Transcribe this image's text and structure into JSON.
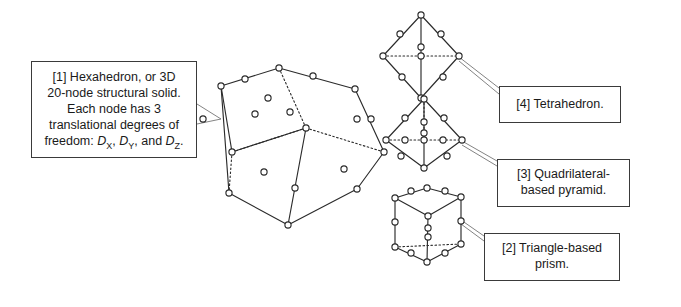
{
  "figure": {
    "background_color": "#ffffff",
    "ink_color": "#2b2b2b",
    "leader_color": "#6d6d6d",
    "box_border_color": "#3a3a3a"
  },
  "callouts": {
    "hexahedron": {
      "index": "[1]",
      "line1": "[1] Hexahedron, or 3D",
      "line2": "20-node structural solid.",
      "line3": "Each node has 3",
      "line4": "translational degrees of",
      "line5_prefix": "freedom: ",
      "dof_x": "D",
      "dof_x_sub": "X",
      "dof_sep1": ", ",
      "dof_y": "D",
      "dof_y_sub": "Y",
      "dof_sep2": ", and ",
      "dof_z": "D",
      "dof_z_sub": "Z",
      "line5_suffix": "."
    },
    "tetrahedron": {
      "index": "[4]",
      "label": "[4] Tetrahedron."
    },
    "pyramid": {
      "index": "[3]",
      "line1": "[3] Quadrilateral-",
      "line2": "based pyramid."
    },
    "prism": {
      "index": "[2]",
      "line1": "[2] Triangle-based",
      "line2": "prism."
    }
  },
  "shapes": {
    "hexahedron": {
      "name": "hexahedron-20-node-solid",
      "node_count": 20,
      "nodes": [
        [
          279,
          68
        ],
        [
          306,
          128
        ],
        [
          232,
          152
        ],
        [
          221,
          86
        ],
        [
          355,
          89
        ],
        [
          384,
          152
        ],
        [
          295,
          188
        ],
        [
          290,
          112
        ],
        [
          313,
          76
        ],
        [
          255,
          114
        ],
        [
          203,
          119
        ],
        [
          245,
          79
        ],
        [
          371,
          119
        ],
        [
          344,
          169
        ],
        [
          264,
          172
        ],
        [
          268,
          98
        ],
        [
          229,
          193
        ],
        [
          288,
          225
        ],
        [
          357,
          189
        ],
        [
          357,
          119
        ]
      ],
      "solid_edges": [
        [
          221,
          86,
          279,
          68
        ],
        [
          279,
          68,
          355,
          89
        ],
        [
          355,
          89,
          384,
          152
        ],
        [
          221,
          86,
          232,
          152
        ],
        [
          232,
          152,
          306,
          128
        ],
        [
          221,
          86,
          229,
          193
        ],
        [
          229,
          193,
          288,
          225
        ],
        [
          288,
          225,
          357,
          189
        ],
        [
          384,
          152,
          357,
          189
        ],
        [
          306,
          128,
          288,
          225
        ]
      ],
      "hidden_edges": [
        [
          279,
          68,
          306,
          128
        ],
        [
          306,
          128,
          232,
          152
        ],
        [
          232,
          152,
          229,
          193
        ],
        [
          306,
          128,
          384,
          152
        ]
      ]
    },
    "tetrahedron": {
      "name": "tetrahedron-10-node-solid",
      "node_count": 10,
      "nodes": [
        [
          421,
          15
        ],
        [
          383,
          56
        ],
        [
          459,
          56
        ],
        [
          421,
          98
        ],
        [
          400,
          34
        ],
        [
          441,
          34
        ],
        [
          421,
          47
        ],
        [
          402,
          77
        ],
        [
          443,
          77
        ],
        [
          421,
          56
        ]
      ],
      "solid_edges": [
        [
          421,
          15,
          383,
          56
        ],
        [
          421,
          15,
          459,
          56
        ],
        [
          383,
          56,
          421,
          98
        ],
        [
          459,
          56,
          421,
          98
        ],
        [
          421,
          15,
          421,
          98
        ]
      ],
      "hidden_edges": [
        [
          383,
          56,
          459,
          56
        ]
      ]
    },
    "pyramid": {
      "name": "quadrilateral-based-pyramid-13-node-solid",
      "node_count": 13,
      "nodes": [
        [
          424,
          99
        ],
        [
          386,
          140
        ],
        [
          462,
          140
        ],
        [
          424,
          168
        ],
        [
          405,
          118
        ],
        [
          444,
          118
        ],
        [
          424,
          133
        ],
        [
          401,
          156
        ],
        [
          447,
          156
        ],
        [
          405,
          140
        ],
        [
          443,
          140
        ],
        [
          424,
          140
        ],
        [
          424,
          122
        ]
      ],
      "solid_edges": [
        [
          424,
          99,
          386,
          140
        ],
        [
          424,
          99,
          462,
          140
        ],
        [
          386,
          140,
          424,
          168
        ],
        [
          462,
          140,
          424,
          168
        ],
        [
          424,
          99,
          424,
          168
        ]
      ],
      "hidden_edges": [
        [
          386,
          140,
          462,
          140
        ],
        [
          424,
          99,
          424,
          140
        ]
      ]
    },
    "prism": {
      "name": "triangle-based-prism-15-node-solid",
      "node_count": 15,
      "nodes": [
        [
          395,
          198
        ],
        [
          427,
          188
        ],
        [
          461,
          197
        ],
        [
          395,
          247
        ],
        [
          427,
          262
        ],
        [
          461,
          244
        ],
        [
          411,
          191
        ],
        [
          445,
          191
        ],
        [
          428,
          216
        ],
        [
          395,
          222
        ],
        [
          461,
          221
        ],
        [
          411,
          253
        ],
        [
          445,
          253
        ],
        [
          428,
          237
        ],
        [
          428,
          228
        ]
      ],
      "solid_edges": [
        [
          395,
          198,
          427,
          188
        ],
        [
          427,
          188,
          461,
          197
        ],
        [
          395,
          198,
          428,
          216
        ],
        [
          461,
          197,
          428,
          216
        ],
        [
          395,
          198,
          395,
          247
        ],
        [
          461,
          197,
          461,
          244
        ],
        [
          395,
          247,
          427,
          262
        ],
        [
          427,
          262,
          461,
          244
        ],
        [
          428,
          216,
          427,
          262
        ]
      ],
      "hidden_edges": [
        [
          395,
          247,
          461,
          244
        ]
      ]
    }
  },
  "leaders": [
    {
      "name": "leader-hexahedron-upper",
      "path": "M197 104 L221 119"
    },
    {
      "name": "leader-hexahedron-lower",
      "path": "M197 124 L221 119"
    },
    {
      "name": "leader-tetrahedron-upper",
      "path": "M459 57 L499 88"
    },
    {
      "name": "leader-tetrahedron-lower",
      "path": "M459 61 L499 94"
    },
    {
      "name": "leader-pyramid-upper",
      "path": "M462 141 L497 161"
    },
    {
      "name": "leader-pyramid-lower",
      "path": "M462 145 L497 166"
    },
    {
      "name": "leader-prism-upper",
      "path": "M461 220 L484 236"
    },
    {
      "name": "leader-prism-lower",
      "path": "M461 224 L484 241"
    }
  ]
}
